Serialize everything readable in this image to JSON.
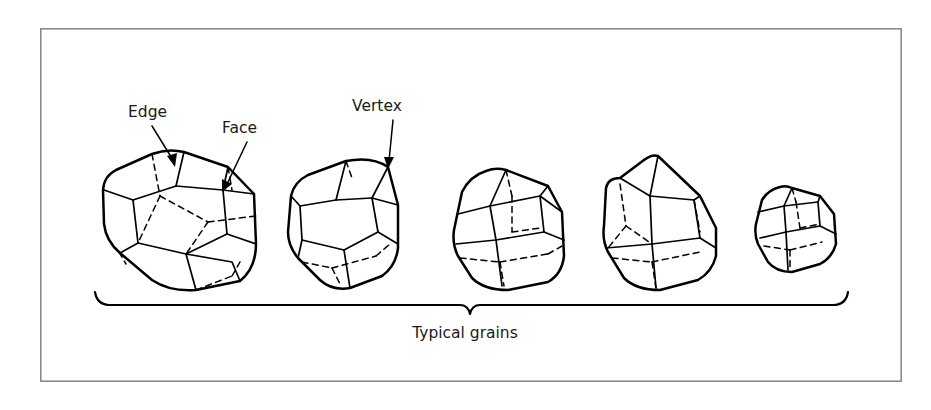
{
  "figure": {
    "background_color": "#ffffff",
    "frame": {
      "x": 40,
      "y": 28,
      "width": 862,
      "height": 354,
      "stroke_color": "#8a8a8a"
    },
    "line_color": "#000000",
    "text_color": "#1a1a1a"
  },
  "callouts": [
    {
      "id": "edge",
      "label": "Edge",
      "text_x": 128,
      "text_y": 117,
      "leader_from": [
        152,
        126
      ],
      "leader_to": [
        174,
        163
      ],
      "arrow_at": [
        175,
        166
      ],
      "arrow_angle": 60,
      "description": "points to a boundary line between two faces of the first grain"
    },
    {
      "id": "face",
      "label": "Face",
      "text_x": 222,
      "text_y": 133,
      "leader_from": [
        246,
        142
      ],
      "leader_to": [
        224,
        186
      ],
      "arrow_at": [
        222,
        190
      ],
      "arrow_angle": 244,
      "description": "points to a flat planar surface of the first grain"
    },
    {
      "id": "vertex",
      "label": "Vertex",
      "text_x": 352,
      "text_y": 111,
      "leader_from": [
        392,
        120
      ],
      "leader_to": [
        388,
        163
      ],
      "arrow_at": [
        388,
        167
      ],
      "arrow_angle": 95,
      "description": "points to a corner point where edges meet on the second grain"
    }
  ],
  "brace": {
    "left_x": 95,
    "right_x": 848,
    "y": 305,
    "center_x": 470,
    "tip_drop": 9,
    "end_rise": 13
  },
  "caption": {
    "label": "Typical grains",
    "x": 465,
    "y": 338
  },
  "grains": [
    {
      "id": "grain-1",
      "name": "largest-polyhedral-grain",
      "center": [
        178,
        218
      ],
      "scale": 1.0,
      "order": 1,
      "relative_size": "largest"
    },
    {
      "id": "grain-2",
      "name": "second-polyhedral-grain",
      "center": [
        350,
        222
      ],
      "scale": 0.82,
      "order": 2,
      "relative_size": "large"
    },
    {
      "id": "grain-3",
      "name": "third-polyhedral-grain",
      "center": [
        512,
        228
      ],
      "scale": 0.74,
      "order": 3,
      "relative_size": "medium"
    },
    {
      "id": "grain-4",
      "name": "fourth-polyhedral-grain",
      "center": [
        662,
        224
      ],
      "scale": 0.8,
      "order": 4,
      "relative_size": "medium"
    },
    {
      "id": "grain-5",
      "name": "smallest-polyhedral-grain",
      "center": [
        800,
        233
      ],
      "scale": 0.5,
      "order": 5,
      "relative_size": "smallest"
    }
  ]
}
